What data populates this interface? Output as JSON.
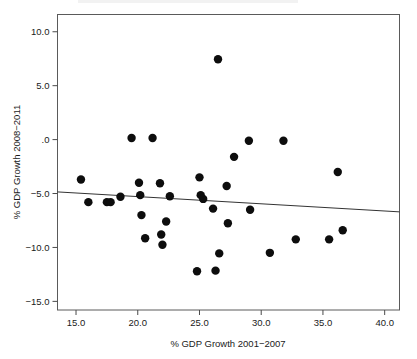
{
  "chart_data": {
    "type": "scatter",
    "title": "",
    "xlabel": "% GDP Growth 2001−2007",
    "ylabel": "% GDP Growth 2008−2011",
    "xlim": [
      13.5,
      41.2
    ],
    "ylim": [
      -15.8,
      11.6
    ],
    "xticks": [
      15.0,
      20.0,
      25.0,
      30.0,
      35.0,
      40.0
    ],
    "xtick_labels": [
      "15.0",
      "20.0",
      "25.0",
      "30.0",
      "35.0",
      "40.0"
    ],
    "yticks": [
      10.0,
      5.0,
      0.0,
      -5.0,
      -10.0,
      -15.0
    ],
    "ytick_labels": [
      "10.0",
      "5.0",
      ".0",
      "−5.0",
      "−10.0",
      "−15.0"
    ],
    "grid": false,
    "legend": null,
    "marker": {
      "shape": "circle",
      "color": "#0d0d0d",
      "size": 4.2
    },
    "points": [
      {
        "x": 15.4,
        "y": -3.7
      },
      {
        "x": 16.0,
        "y": -5.8
      },
      {
        "x": 17.5,
        "y": -5.8
      },
      {
        "x": 17.8,
        "y": -5.8
      },
      {
        "x": 18.6,
        "y": -5.3
      },
      {
        "x": 19.5,
        "y": 0.15
      },
      {
        "x": 20.1,
        "y": -4.0
      },
      {
        "x": 20.2,
        "y": -5.15
      },
      {
        "x": 20.3,
        "y": -7.0
      },
      {
        "x": 20.6,
        "y": -9.15
      },
      {
        "x": 21.2,
        "y": 0.15
      },
      {
        "x": 21.8,
        "y": -4.05
      },
      {
        "x": 21.9,
        "y": -8.8
      },
      {
        "x": 22.0,
        "y": -9.75
      },
      {
        "x": 22.3,
        "y": -7.6
      },
      {
        "x": 22.6,
        "y": -5.25
      },
      {
        "x": 24.8,
        "y": -12.2
      },
      {
        "x": 25.0,
        "y": -3.5
      },
      {
        "x": 25.1,
        "y": -5.15
      },
      {
        "x": 25.3,
        "y": -5.5
      },
      {
        "x": 26.1,
        "y": -6.4
      },
      {
        "x": 26.3,
        "y": -12.15
      },
      {
        "x": 26.5,
        "y": 7.45
      },
      {
        "x": 26.6,
        "y": -10.55
      },
      {
        "x": 27.2,
        "y": -4.3
      },
      {
        "x": 27.3,
        "y": -7.75
      },
      {
        "x": 27.8,
        "y": -1.6
      },
      {
        "x": 29.0,
        "y": -0.1
      },
      {
        "x": 29.1,
        "y": -6.5
      },
      {
        "x": 30.7,
        "y": -10.5
      },
      {
        "x": 31.8,
        "y": -0.1
      },
      {
        "x": 32.8,
        "y": -9.25
      },
      {
        "x": 35.5,
        "y": -9.25
      },
      {
        "x": 36.2,
        "y": -3.0
      },
      {
        "x": 36.6,
        "y": -8.4
      }
    ],
    "fit_line": {
      "x_start": 13.5,
      "y_start": -4.85,
      "x_end": 41.2,
      "y_end": -6.7,
      "color": "#333333"
    }
  }
}
